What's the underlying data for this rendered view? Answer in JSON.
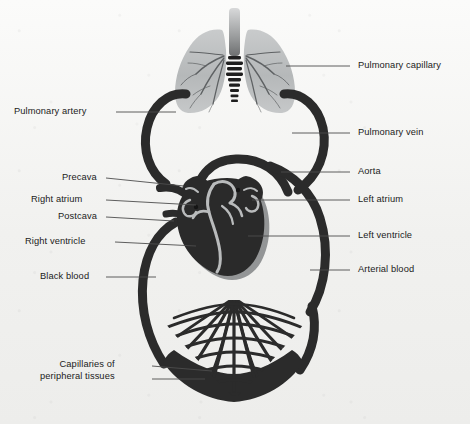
{
  "figure": {
    "background_color": "#f3f3f1",
    "vessel_color": "#2b2b2b",
    "lung_color": "#b9bcbd",
    "heart_shadow_color": "#8d8f90",
    "label_color": "#1b1b1b"
  },
  "labels": {
    "left": [
      {
        "id": "pulmonary-artery",
        "text": "Pulmonary artery",
        "x": 14,
        "y": 106,
        "leader_x1": 116,
        "leader_y1": 112,
        "leader_x2": 176,
        "leader_y2": 112
      },
      {
        "id": "precava",
        "text": "Precava",
        "x": 62,
        "y": 172,
        "leader_x1": 106,
        "leader_y1": 178,
        "leader_x2": 184,
        "leader_y2": 186
      },
      {
        "id": "right-atrium",
        "text": "Right atrium",
        "x": 31,
        "y": 194,
        "leader_x1": 106,
        "leader_y1": 200,
        "leader_x2": 196,
        "leader_y2": 205
      },
      {
        "id": "postcava",
        "text": "Postcava",
        "x": 58,
        "y": 211,
        "leader_x1": 106,
        "leader_y1": 217,
        "leader_x2": 174,
        "leader_y2": 221
      },
      {
        "id": "right-ventricle",
        "text": "Right ventricle",
        "x": 25,
        "y": 236,
        "leader_x1": 115,
        "leader_y1": 242,
        "leader_x2": 196,
        "leader_y2": 246
      },
      {
        "id": "black-blood",
        "text": "Black blood",
        "x": 40,
        "y": 271,
        "leader_x1": 106,
        "leader_y1": 277,
        "leader_x2": 156,
        "leader_y2": 277
      },
      {
        "id": "capillaries-peripheral-tissues",
        "text": "Capillaries of\nperipheral tissues",
        "line1": "Capillaries of",
        "line2": "peripheral tissues",
        "x": 40,
        "y": 359,
        "leader_x1": 152,
        "leader_y1": 366,
        "leader_x2": 212,
        "leader_y2": 371,
        "leader2_x1": 152,
        "leader2_y1": 379,
        "leader2_x2": 205,
        "leader2_y2": 379
      }
    ],
    "right": [
      {
        "id": "pulmonary-capillary",
        "text": "Pulmonary capillary",
        "x": 358,
        "y": 60,
        "leader_x1": 286,
        "leader_y1": 66,
        "leader_x2": 350,
        "leader_y2": 66
      },
      {
        "id": "pulmonary-vein",
        "text": "Pulmonary vein",
        "x": 358,
        "y": 127,
        "leader_x1": 292,
        "leader_y1": 133,
        "leader_x2": 350,
        "leader_y2": 133
      },
      {
        "id": "aorta",
        "text": "Aorta",
        "x": 358,
        "y": 166,
        "leader_x1": 281,
        "leader_y1": 172,
        "leader_x2": 350,
        "leader_y2": 172
      },
      {
        "id": "left-atrium",
        "text": "Left atrium",
        "x": 358,
        "y": 194,
        "leader_x1": 252,
        "leader_y1": 200,
        "leader_x2": 350,
        "leader_y2": 200
      },
      {
        "id": "left-ventricle",
        "text": "Left ventricle",
        "x": 358,
        "y": 230,
        "leader_x1": 248,
        "leader_y1": 236,
        "leader_x2": 350,
        "leader_y2": 236
      },
      {
        "id": "arterial-blood",
        "text": "Arterial blood",
        "x": 358,
        "y": 264,
        "leader_x1": 310,
        "leader_y1": 270,
        "leader_x2": 350,
        "leader_y2": 270
      }
    ]
  }
}
